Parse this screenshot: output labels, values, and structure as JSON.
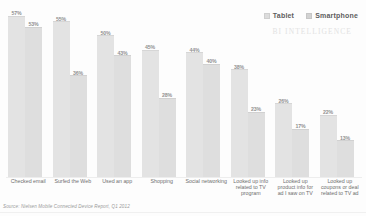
{
  "chart_data": {
    "type": "bar",
    "title": "",
    "subtitle": "",
    "xlabel": "",
    "ylabel": "",
    "ylim": [
      0,
      60
    ],
    "grid": false,
    "legend_position": "top-right",
    "value_suffix": "%",
    "categories": [
      "Checked email",
      "Surfed the Web",
      "Used an app",
      "Shopping",
      "Social networking",
      "Looked up info related to TV program",
      "Looked up product info for ad I saw on TV",
      "Looked up coupons or deal related to TV ad"
    ],
    "series": [
      {
        "name": "Tablet",
        "color": "#e3e3e3",
        "values": [
          57,
          55,
          50,
          45,
          44,
          38,
          26,
          22
        ],
        "labels": [
          "57%",
          "55%",
          "50%",
          "45%",
          "44%",
          "38%",
          "26%",
          "22%"
        ]
      },
      {
        "name": "Smartphone",
        "color": "#dedede",
        "values": [
          53,
          36,
          43,
          28,
          40,
          23,
          17,
          13
        ],
        "labels": [
          "53%",
          "36%",
          "43%",
          "28%",
          "40%",
          "23%",
          "17%",
          "13%"
        ]
      }
    ],
    "source": "Source: Nielsen Mobile Connected Device Report, Q1 2012",
    "watermark": "BI INTELLIGENCE"
  },
  "legend": {
    "items": [
      {
        "label": "Tablet"
      },
      {
        "label": "Smartphone"
      }
    ]
  }
}
